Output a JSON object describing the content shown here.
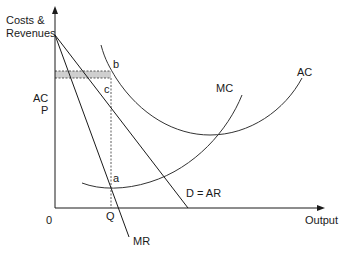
{
  "diagram": {
    "type": "economics-monopoly-cost-revenue",
    "y_axis_label_line1": "Costs &",
    "y_axis_label_line2": "Revenues",
    "x_axis_label": "Output",
    "origin_label": "0",
    "curves": {
      "mc": "MC",
      "ac": "AC",
      "demand": "D = AR",
      "mr": "MR"
    },
    "price_labels": {
      "ac": "AC",
      "p": "P"
    },
    "quantity_label": "Q",
    "points": {
      "a": "a",
      "b": "b",
      "c": "c"
    },
    "colors": {
      "line": "#1a1a1a",
      "curve": "#333333",
      "shading": "#c8c8c8"
    }
  }
}
